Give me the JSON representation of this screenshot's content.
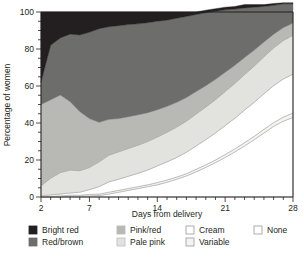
{
  "chart_data": {
    "type": "area",
    "title": "",
    "subtitle": "",
    "xlabel": "Days from delivery",
    "ylabel": "Percentage of women",
    "xlim": [
      2,
      28
    ],
    "ylim": [
      0,
      100
    ],
    "grid": false,
    "stacked": true,
    "stack_order": "bottom-to-top",
    "legend_position": "bottom",
    "x_tick_labels": [
      "2",
      "7",
      "14",
      "21",
      "28"
    ],
    "x_tick_values": [
      2,
      7,
      14,
      21,
      28
    ],
    "x_minor_tick_step": 1,
    "y_tick_labels": [
      "0",
      "20",
      "40",
      "60",
      "80",
      "100"
    ],
    "y_tick_values": [
      0,
      20,
      40,
      60,
      80,
      100
    ],
    "x": [
      2,
      3,
      4,
      5,
      6,
      7,
      8,
      9,
      10,
      11,
      12,
      13,
      14,
      15,
      16,
      17,
      18,
      19,
      20,
      21,
      22,
      23,
      24,
      25,
      26,
      27,
      28
    ],
    "series": [
      {
        "name": "None",
        "color": "#ffffff",
        "values": [
          0,
          0,
          0,
          0.4,
          0.4,
          0.6,
          0.8,
          1.6,
          2.6,
          3.6,
          4.6,
          5.6,
          6.6,
          8.0,
          9.6,
          11.4,
          13.6,
          16.0,
          18.6,
          21.4,
          24.4,
          27.6,
          31.0,
          34.6,
          38.2,
          41.0,
          43.0
        ]
      },
      {
        "name": "Variable",
        "color": "#f4f4f2",
        "values": [
          0,
          0.4,
          0.6,
          0.6,
          0.6,
          0.8,
          0.8,
          1.0,
          1.0,
          1.0,
          1.0,
          1.0,
          1.2,
          1.2,
          1.2,
          1.2,
          1.4,
          1.4,
          1.4,
          1.6,
          1.6,
          1.8,
          1.8,
          2.0,
          2.0,
          2.2,
          2.4
        ]
      },
      {
        "name": "Cream",
        "color": "#ffffff",
        "values": [
          0.6,
          0.8,
          1.0,
          1.2,
          1.6,
          2.6,
          4.0,
          5.6,
          6.0,
          6.6,
          7.2,
          8.0,
          9.0,
          9.8,
          10.6,
          11.6,
          12.6,
          13.6,
          14.6,
          15.6,
          16.6,
          17.6,
          18.4,
          19.2,
          20.0,
          20.6,
          21.0
        ]
      },
      {
        "name": "Pale pink",
        "color": "#e2e2df",
        "values": [
          5.4,
          9.0,
          11.6,
          12.4,
          11.6,
          12.0,
          13.4,
          14.4,
          14.8,
          15.0,
          15.2,
          15.4,
          15.6,
          16.0,
          16.4,
          16.8,
          17.2,
          17.6,
          18.0,
          18.4,
          18.8,
          19.2,
          19.6,
          20.0,
          20.4,
          20.8,
          21.0
        ]
      },
      {
        "name": "Pink/red",
        "color": "#b8b8b4",
        "values": [
          44.0,
          42.4,
          42.0,
          37.0,
          32.0,
          26.4,
          21.4,
          19.4,
          18.0,
          17.2,
          16.4,
          15.6,
          14.8,
          14.0,
          13.4,
          12.8,
          12.2,
          11.6,
          11.0,
          10.4,
          9.8,
          9.2,
          8.6,
          8.0,
          7.4,
          7.0,
          6.6
        ]
      },
      {
        "name": "Red/brown",
        "color": "#6d6d6c",
        "values": [
          12.0,
          29.4,
          30.8,
          36.4,
          41.4,
          46.6,
          50.6,
          50.0,
          50.2,
          49.8,
          49.2,
          48.6,
          47.8,
          46.6,
          45.4,
          43.8,
          41.6,
          39.4,
          36.8,
          33.8,
          30.4,
          26.8,
          23.2,
          19.2,
          15.6,
          12.8,
          10.4
        ]
      },
      {
        "name": "Bright red",
        "color": "#231f20",
        "values": [
          38.0,
          18.0,
          14.0,
          12.0,
          12.4,
          11.0,
          9.0,
          8.0,
          7.4,
          6.8,
          6.4,
          5.8,
          5.0,
          4.4,
          3.4,
          2.4,
          1.4,
          1.4,
          1.4,
          1.4,
          1.4,
          1.8,
          1.4,
          1.0,
          1.0,
          0.6,
          0.6
        ]
      }
    ],
    "legend": [
      {
        "label": "Bright red",
        "color": "#231f20",
        "border": "#231f20"
      },
      {
        "label": "Red/brown",
        "color": "#6d6d6c",
        "border": "#6d6d6c"
      },
      {
        "label": "Pink/red",
        "color": "#b8b8b4",
        "border": "#b8b8b4"
      },
      {
        "label": "Pale pink",
        "color": "#e2e2df",
        "border": "#bdbdbd"
      },
      {
        "label": "Cream",
        "color": "#ffffff",
        "border": "#9a9a9a"
      },
      {
        "label": "Variable",
        "color": "#f4f4f2",
        "border": "#9a9a9a"
      },
      {
        "label": "None",
        "color": "#ffffff",
        "border": "#9a9a9a"
      }
    ]
  },
  "legend_layout": {
    "columns": [
      {
        "rows": [
          "Bright red",
          "Red/brown"
        ]
      },
      {
        "rows": [
          "Pink/red",
          "Pale pink"
        ]
      },
      {
        "rows": [
          "Cream",
          "Variable"
        ]
      },
      {
        "rows": [
          "None"
        ]
      }
    ]
  }
}
